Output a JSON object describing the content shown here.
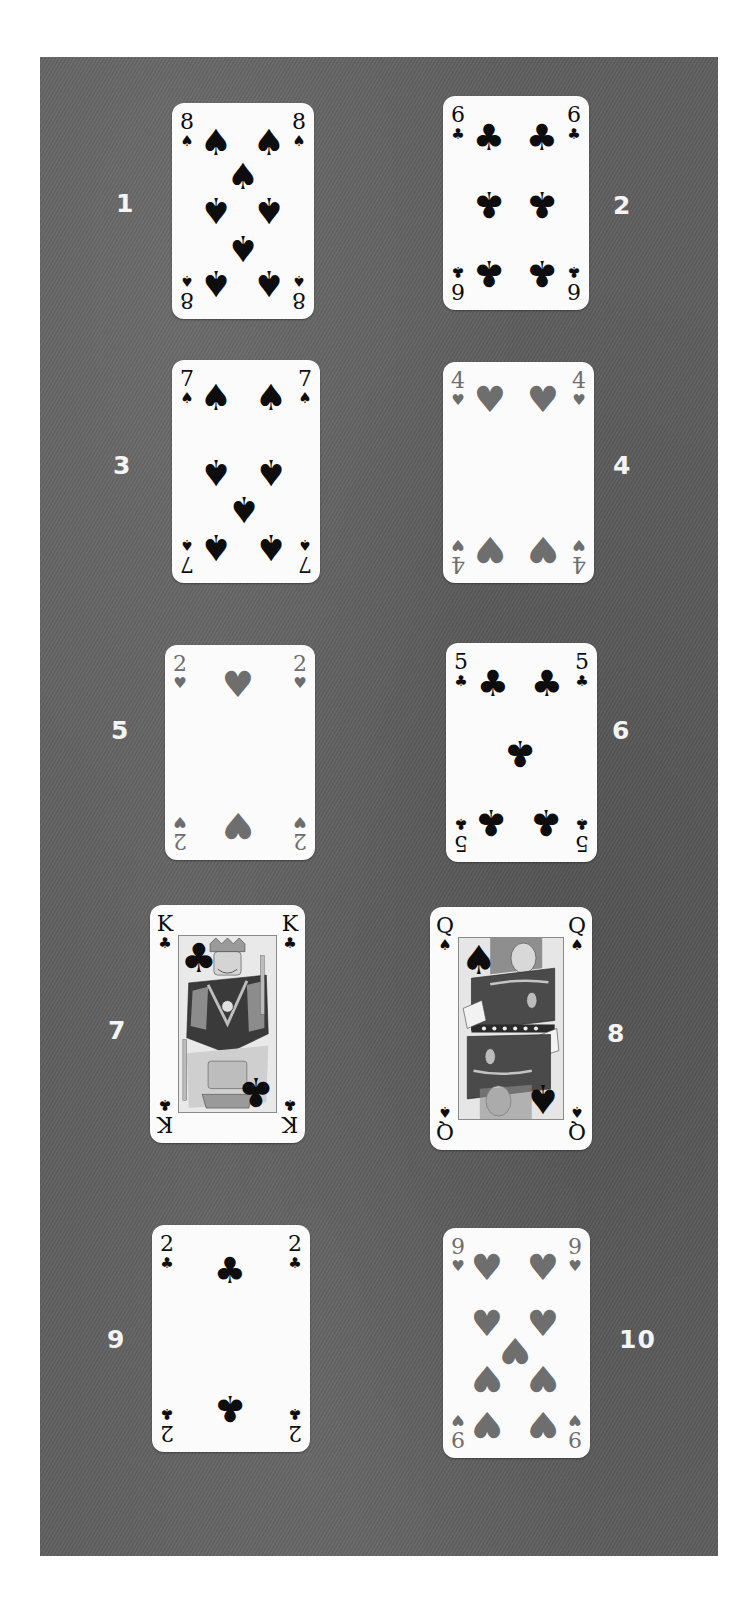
{
  "board": {
    "background_color": "#5d5d5d"
  },
  "cards": [
    {
      "label": "1",
      "rank": "8",
      "suit": "spades",
      "suit_glyph": "♠",
      "tone": "black",
      "face": false
    },
    {
      "label": "2",
      "rank": "6",
      "suit": "clubs",
      "suit_glyph": "♣",
      "tone": "black",
      "face": false
    },
    {
      "label": "3",
      "rank": "7",
      "suit": "spades",
      "suit_glyph": "♠",
      "tone": "black",
      "face": false
    },
    {
      "label": "4",
      "rank": "4",
      "suit": "hearts",
      "suit_glyph": "♥",
      "tone": "gray",
      "face": false
    },
    {
      "label": "5",
      "rank": "2",
      "suit": "hearts",
      "suit_glyph": "♥",
      "tone": "gray",
      "face": false
    },
    {
      "label": "6",
      "rank": "5",
      "suit": "clubs",
      "suit_glyph": "♣",
      "tone": "black",
      "face": false
    },
    {
      "label": "7",
      "rank": "K",
      "suit": "clubs",
      "suit_glyph": "♣",
      "tone": "black",
      "face": true,
      "figure": "king"
    },
    {
      "label": "8",
      "rank": "Q",
      "suit": "spades",
      "suit_glyph": "♠",
      "tone": "black",
      "face": true,
      "figure": "queen"
    },
    {
      "label": "9",
      "rank": "2",
      "suit": "clubs",
      "suit_glyph": "♣",
      "tone": "black",
      "face": false
    },
    {
      "label": "10",
      "rank": "9",
      "suit": "hearts",
      "suit_glyph": "♥",
      "tone": "gray",
      "face": false
    }
  ],
  "colors": {
    "pip_black": "#0d0d0d",
    "pip_heart_gray": "#6e6e6e",
    "card_face": "#fbfbfb",
    "label_text": "#f4f4f4"
  }
}
